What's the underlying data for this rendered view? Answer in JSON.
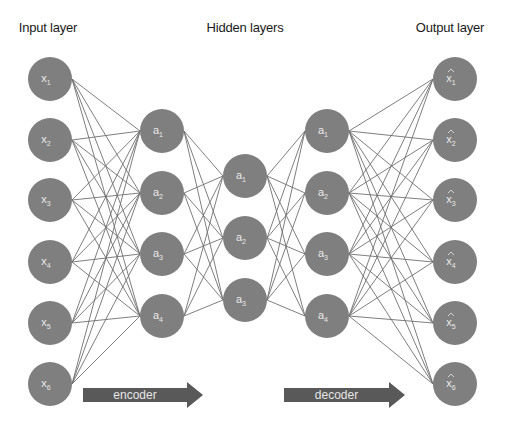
{
  "diagram": {
    "type": "autoencoder-neural-network",
    "titles": {
      "input": "Input layer",
      "hidden": "Hidden layers",
      "output": "Output layer"
    },
    "colors": {
      "node_fill": "#7f7f7f",
      "edge": "#6f6f6f",
      "arrow_fill": "#595959",
      "label_text": "#eaeaea",
      "title_text": "#1a1a1a"
    },
    "node_radius": 22,
    "layers": [
      {
        "name": "input",
        "x": 50,
        "base": "x",
        "hat": false,
        "subs": [
          "1",
          "2",
          "3",
          "4",
          "5",
          "6"
        ],
        "ys": [
          79,
          140,
          200,
          262,
          323,
          384
        ]
      },
      {
        "name": "hidden-encoder",
        "x": 162,
        "base": "a",
        "hat": false,
        "subs": [
          "1",
          "2",
          "3",
          "4"
        ],
        "ys": [
          131,
          193,
          254,
          316
        ]
      },
      {
        "name": "bottleneck",
        "x": 245,
        "base": "a",
        "hat": false,
        "subs": [
          "1",
          "2",
          "3"
        ],
        "ys": [
          176,
          238,
          300
        ]
      },
      {
        "name": "hidden-decoder",
        "x": 327,
        "base": "a",
        "hat": false,
        "subs": [
          "1",
          "2",
          "3",
          "4"
        ],
        "ys": [
          131,
          193,
          254,
          316
        ]
      },
      {
        "name": "output",
        "x": 455,
        "base": "x",
        "hat": true,
        "subs": [
          "1",
          "2",
          "3",
          "4",
          "5",
          "6"
        ],
        "ys": [
          79,
          140,
          200,
          262,
          323,
          384
        ]
      }
    ],
    "arrows": [
      {
        "name": "encoder",
        "label": "encoder",
        "x1": 83,
        "x2": 203,
        "y": 395,
        "h": 14,
        "head_w": 16,
        "head_h": 26
      },
      {
        "name": "decoder",
        "label": "decoder",
        "x1": 284,
        "x2": 405,
        "y": 395,
        "h": 14,
        "head_w": 16,
        "head_h": 26
      }
    ]
  }
}
